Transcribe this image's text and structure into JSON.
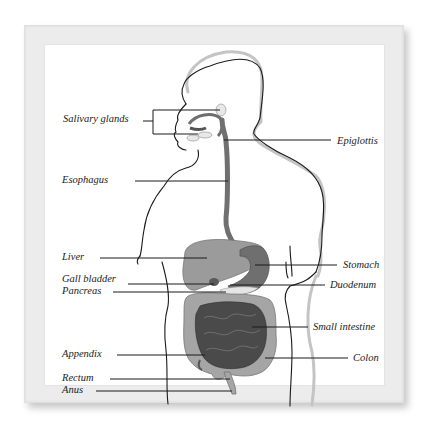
{
  "diagram": {
    "colors": {
      "frame": "#ececec",
      "background": "#ffffff",
      "outline": "#1a1a1a",
      "outline_shadow": "#b8b8b8",
      "organ_light": "#9a9a9a",
      "organ_mid": "#7a7a7a",
      "organ_dark": "#4a4a4a",
      "esophagus": "#6e6e6e",
      "leader_line": "#1a1a1a"
    },
    "labels_left": [
      {
        "text": "Salivary glands",
        "x": 63,
        "y": 120
      },
      {
        "text": "Esophagus",
        "x": 62,
        "y": 181
      },
      {
        "text": "Liver",
        "x": 62,
        "y": 258
      },
      {
        "text": "Gall bladder",
        "x": 62,
        "y": 280
      },
      {
        "text": "Pancreas",
        "x": 62,
        "y": 292
      },
      {
        "text": "Appendix",
        "x": 62,
        "y": 355
      },
      {
        "text": "Rectum",
        "x": 62,
        "y": 379
      },
      {
        "text": "Anus",
        "x": 62,
        "y": 391
      }
    ],
    "labels_right": [
      {
        "text": "Epiglottis",
        "x": 337,
        "y": 142
      },
      {
        "text": "Stomach",
        "x": 343,
        "y": 266
      },
      {
        "text": "Duodenum",
        "x": 330,
        "y": 286
      },
      {
        "text": "Small intestine",
        "x": 313,
        "y": 328
      },
      {
        "text": "Colon",
        "x": 353,
        "y": 359
      }
    ]
  }
}
